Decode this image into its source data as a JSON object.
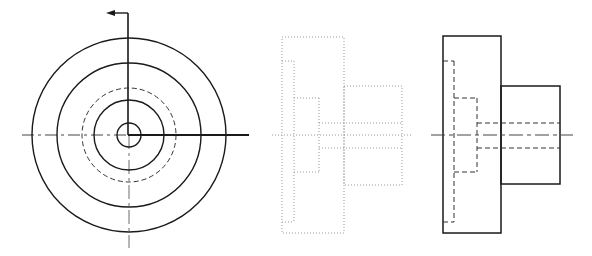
{
  "drawing": {
    "type": "orthographic-projection",
    "background": "#ffffff",
    "colors": {
      "solid": "#1a1a1a",
      "hidden": "#333333",
      "center": "#444444",
      "faint": "#9a9a9a"
    },
    "views": {
      "front": {
        "label": "front-view-circular",
        "center": [
          129,
          135
        ],
        "circles": [
          {
            "name": "outer-circle",
            "r": 97,
            "style": "solid"
          },
          {
            "name": "flange-circle",
            "r": 72,
            "style": "solid"
          },
          {
            "name": "hidden-counterbore-circle",
            "r": 47,
            "style": "dashed"
          },
          {
            "name": "boss-circle",
            "r": 35,
            "style": "solid"
          },
          {
            "name": "bore-circle",
            "r": 12,
            "style": "solid"
          }
        ],
        "cutting_plane": {
          "arrow_tip": [
            106,
            13
          ],
          "corner": [
            128,
            13
          ],
          "end": [
            128,
            135
          ],
          "horizontal_end": [
            249,
            135
          ]
        },
        "centerlines": {
          "horizontal": [
            22,
            249
          ],
          "vertical": [
            13,
            248
          ]
        }
      },
      "middle": {
        "label": "side-view-faint-dotted",
        "outer_rect": [
          282,
          37,
          344,
          233
        ],
        "boss_rect": [
          344,
          86,
          402,
          185
        ],
        "step1": {
          "x": 294,
          "y1": 61,
          "y2": 222
        },
        "step2": {
          "x": 319,
          "y1": 98,
          "y2": 172
        },
        "bore": {
          "x1": 319,
          "x2": 402,
          "y1": 123,
          "y2": 148
        },
        "centerline": [
          272,
          412,
          135
        ]
      },
      "right": {
        "label": "side-view-hidden-lines",
        "flange_rect": [
          443,
          36,
          501,
          233
        ],
        "boss_rect": [
          501,
          86,
          560,
          184
        ],
        "step1": {
          "x": 454,
          "y1": 61,
          "y2": 222
        },
        "step2": {
          "x": 477,
          "y1": 98,
          "y2": 172
        },
        "bore": {
          "x1": 477,
          "x2": 560,
          "y1": 123,
          "y2": 148
        },
        "centerline": [
          431,
          573,
          135
        ]
      }
    }
  }
}
